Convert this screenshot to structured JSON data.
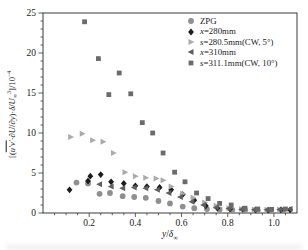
{
  "figure": {
    "background": "#ffffff",
    "frame_color": "#3a3a3a",
    "text_color": "#1a1a1a"
  },
  "chart_data": {
    "type": "scatter",
    "title": "",
    "grid": false,
    "legend_position": "top-right-inside",
    "xlabel_parts": [
      {
        "t": "y",
        "italic": true
      },
      {
        "t": "/"
      },
      {
        "t": "δ",
        "italic": true
      },
      {
        "t": "∞",
        "sub": true
      }
    ],
    "ylabel_parts": [
      {
        "t": "[("
      },
      {
        "t": "u′v′",
        "italic": true,
        "overline": true
      },
      {
        "t": "·∂"
      },
      {
        "t": "U",
        "italic": true
      },
      {
        "t": "/∂"
      },
      {
        "t": "y",
        "italic": true
      },
      {
        "t": ")·"
      },
      {
        "t": "δ",
        "italic": true
      },
      {
        "t": "/"
      },
      {
        "t": "U",
        "italic": true
      },
      {
        "t": "∞",
        "sub": true
      },
      {
        "t": "3",
        "sup": true
      },
      {
        "t": "]/10"
      },
      {
        "t": "−4",
        "sup": true
      }
    ],
    "x_axis": {
      "min": 0,
      "max": 1.1,
      "minor_step": 0.05,
      "major_ticks": [
        {
          "v": 0.2,
          "label": "0.2"
        },
        {
          "v": 0.4,
          "label": "0.4"
        },
        {
          "v": 0.6,
          "label": "0.6"
        },
        {
          "v": 0.8,
          "label": "0.8"
        },
        {
          "v": 1.0,
          "label": "1.0"
        }
      ]
    },
    "y_axis": {
      "min": 0,
      "max": 25,
      "minor_step": 1,
      "major_ticks": [
        {
          "v": 0,
          "label": "0"
        },
        {
          "v": 5,
          "label": "5"
        },
        {
          "v": 10,
          "label": "10"
        },
        {
          "v": 15,
          "label": "15"
        },
        {
          "v": 20,
          "label": "20"
        },
        {
          "v": 25,
          "label": "25"
        }
      ]
    },
    "series": [
      {
        "name": "ZPG",
        "marker": "circle",
        "color": "#8f8f8f",
        "label_parts": [
          {
            "t": "ZPG"
          }
        ],
        "points": [
          [
            0.145,
            3.8
          ],
          [
            0.195,
            3.7
          ],
          [
            0.245,
            2.4
          ],
          [
            0.29,
            2.5
          ],
          [
            0.345,
            2.1
          ],
          [
            0.395,
            2.0
          ],
          [
            0.445,
            1.9
          ],
          [
            0.5,
            1.5
          ],
          [
            0.55,
            1.2
          ],
          [
            0.605,
            0.8
          ],
          [
            0.655,
            0.6
          ],
          [
            0.71,
            0.5
          ],
          [
            0.765,
            0.45
          ],
          [
            0.82,
            0.4
          ],
          [
            0.875,
            0.35
          ],
          [
            0.93,
            0.3
          ],
          [
            0.985,
            0.3
          ],
          [
            1.04,
            0.35
          ]
        ]
      },
      {
        "name": "x=280mm",
        "marker": "diamond",
        "color": "#1c1c1c",
        "label_parts": [
          {
            "t": "x",
            "italic": true
          },
          {
            "t": "=280mm"
          }
        ],
        "points": [
          [
            0.115,
            2.9
          ],
          [
            0.195,
            4.0
          ],
          [
            0.205,
            4.6
          ],
          [
            0.25,
            4.8
          ],
          [
            0.295,
            3.9
          ],
          [
            0.35,
            3.7
          ],
          [
            0.4,
            3.4
          ],
          [
            0.45,
            3.3
          ],
          [
            0.505,
            3.2
          ],
          [
            0.555,
            2.9
          ],
          [
            0.605,
            2.3
          ],
          [
            0.655,
            1.6
          ],
          [
            0.705,
            0.9
          ],
          [
            0.755,
            0.6
          ],
          [
            0.81,
            0.5
          ],
          [
            0.865,
            0.45
          ],
          [
            0.92,
            0.4
          ],
          [
            0.975,
            0.35
          ],
          [
            1.03,
            0.4
          ],
          [
            1.07,
            0.4
          ]
        ]
      },
      {
        "name": "s=280.5mm(CW, 5°)",
        "marker": "triangle-right",
        "color": "#aaaaaa",
        "label_parts": [
          {
            "t": "s",
            "italic": true
          },
          {
            "t": "=280.5mm(CW, 5°)"
          }
        ],
        "points": [
          [
            0.12,
            9.5
          ],
          [
            0.17,
            9.9
          ],
          [
            0.215,
            9.1
          ],
          [
            0.26,
            8.9
          ],
          [
            0.305,
            7.5
          ],
          [
            0.355,
            5.1
          ],
          [
            0.4,
            4.6
          ],
          [
            0.445,
            4.4
          ],
          [
            0.49,
            4.3
          ],
          [
            0.52,
            4.1
          ],
          [
            0.555,
            3.3
          ],
          [
            0.605,
            2.4
          ],
          [
            0.65,
            1.9
          ],
          [
            0.7,
            1.3
          ],
          [
            0.75,
            0.9
          ],
          [
            0.805,
            0.6
          ],
          [
            0.86,
            0.5
          ],
          [
            0.915,
            0.45
          ],
          [
            0.97,
            0.4
          ],
          [
            1.025,
            0.45
          ]
        ]
      },
      {
        "name": "x=310mm",
        "marker": "triangle-left",
        "color": "#5f5f5f",
        "label_parts": [
          {
            "t": "x",
            "italic": true
          },
          {
            "t": "=310mm"
          }
        ],
        "points": [
          [
            0.245,
            3.6
          ],
          [
            0.295,
            3.3
          ],
          [
            0.345,
            3.1
          ],
          [
            0.395,
            3.2
          ],
          [
            0.445,
            3.1
          ],
          [
            0.495,
            2.9
          ],
          [
            0.545,
            2.5
          ],
          [
            0.595,
            2.0
          ],
          [
            0.645,
            1.4
          ],
          [
            0.695,
            1.0
          ],
          [
            0.75,
            0.7
          ],
          [
            0.805,
            0.55
          ],
          [
            0.86,
            0.45
          ],
          [
            0.915,
            0.4
          ],
          [
            0.97,
            0.4
          ],
          [
            1.025,
            0.45
          ],
          [
            1.07,
            0.5
          ]
        ]
      },
      {
        "name": "s=311.1mm(CW, 10°)",
        "marker": "square",
        "color": "#6b6b6b",
        "label_parts": [
          {
            "t": "s",
            "italic": true
          },
          {
            "t": "=311.1mm(CW, 10°)"
          }
        ],
        "points": [
          [
            0.18,
            23.9
          ],
          [
            0.24,
            19.3
          ],
          [
            0.285,
            14.8
          ],
          [
            0.33,
            17.5
          ],
          [
            0.38,
            14.9
          ],
          [
            0.43,
            11.3
          ],
          [
            0.475,
            10.0
          ],
          [
            0.52,
            7.5
          ],
          [
            0.57,
            5.1
          ],
          [
            0.615,
            3.9
          ],
          [
            0.665,
            2.5
          ],
          [
            0.715,
            1.8
          ],
          [
            0.765,
            1.2
          ],
          [
            0.815,
            1.0
          ],
          [
            0.875,
            0.6
          ],
          [
            0.93,
            0.5
          ],
          [
            0.99,
            0.45
          ],
          [
            1.05,
            0.5
          ]
        ]
      }
    ]
  }
}
